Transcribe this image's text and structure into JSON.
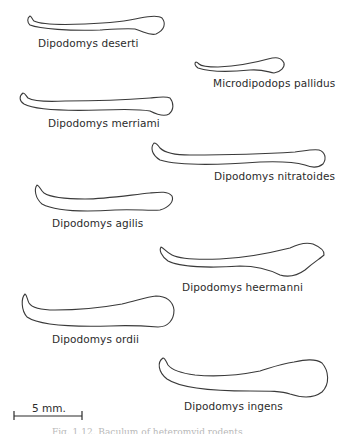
{
  "figure": {
    "specimens": [
      {
        "id": "deserti",
        "label": "Dipodomys deserti"
      },
      {
        "id": "pallidus",
        "label": "Microdipodops pallidus"
      },
      {
        "id": "merriami",
        "label": "Dipodomys merriami"
      },
      {
        "id": "nitratoides",
        "label": "Dipodomys nitratoides"
      },
      {
        "id": "agilis",
        "label": "Dipodomys agilis"
      },
      {
        "id": "heermanni",
        "label": "Dipodomys heermanni"
      },
      {
        "id": "ordii",
        "label": "Dipodomys ordii"
      },
      {
        "id": "ingens",
        "label": "Dipodomys ingens"
      }
    ],
    "scale_bar": {
      "label": "5 mm."
    },
    "caption": "Fig. 1.12. Baculum of heteromyid rodents"
  }
}
